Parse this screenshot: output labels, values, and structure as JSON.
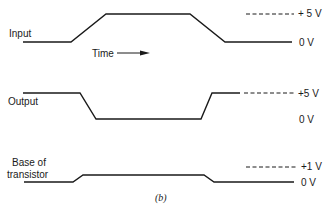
{
  "figure": {
    "caption": "(b)",
    "signals": [
      {
        "name": "Input",
        "high_label": "+ 5 V",
        "low_label": "0 V"
      },
      {
        "name": "Output",
        "high_label": "+5 V",
        "low_label": "0 V"
      },
      {
        "name_line1": "Base of",
        "name_line2": "transistor",
        "high_label": "+1 V",
        "low_label": "0 V"
      }
    ],
    "time_label": "Time"
  }
}
